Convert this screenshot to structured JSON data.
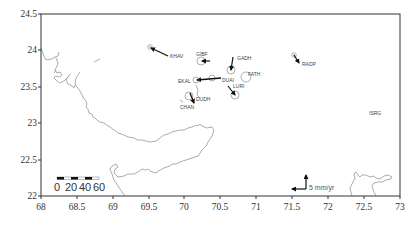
{
  "map": {
    "title": "",
    "frame": {
      "left": 41,
      "top": 14,
      "right": 400,
      "bottom": 196
    },
    "x_axis": {
      "min": 68,
      "max": 73,
      "ticks": [
        "68",
        "68.5",
        "69",
        "69.5",
        "70",
        "70.5",
        "71",
        "71.5",
        "72",
        "72.5",
        "73"
      ]
    },
    "y_axis": {
      "min": 22,
      "max": 24.5,
      "ticks": [
        "22",
        "22.5",
        "23",
        "23.5",
        "24",
        "24.5"
      ]
    },
    "scale_bar": {
      "labels": [
        "0",
        "20",
        "40",
        "60"
      ]
    },
    "reference_vector": {
      "label": "5 mm/yr"
    },
    "stations": [
      {
        "name": "KHAV",
        "lon": 69.55,
        "lat": 24.02,
        "ve": 4.0,
        "vn": -2.2
      },
      {
        "name": "GIBF",
        "lon": 70.25,
        "lat": 23.83,
        "ve": 1.0,
        "vn": 0.0
      },
      {
        "name": "GADH",
        "lon": 70.67,
        "lat": 23.73,
        "ve": 0.5,
        "vn": 2.6
      },
      {
        "name": "FATH",
        "lon": 70.98,
        "lat": 23.58,
        "ve": 0.0,
        "vn": 0.0
      },
      {
        "name": "EKAL",
        "lon": 70.08,
        "lat": 23.58,
        "ve": 0.0,
        "vn": 0.0
      },
      {
        "name": "DUAI",
        "lon": 70.45,
        "lat": 23.6,
        "ve": -5.0,
        "vn": 0.4
      },
      {
        "name": "LURI",
        "lon": 70.8,
        "lat": 23.35,
        "ve": -1.4,
        "vn": 2.6
      },
      {
        "name": "DUDH",
        "lon": 70.05,
        "lat": 23.4,
        "ve": -1.2,
        "vn": 2.4
      },
      {
        "name": "CHAN",
        "lon": 69.95,
        "lat": 23.4,
        "ve": 0.0,
        "vn": 0.0
      },
      {
        "name": "RADP",
        "lon": 71.5,
        "lat": 23.87,
        "ve": -1.2,
        "vn": 1.6
      },
      {
        "name": "ISRG",
        "lon": 72.8,
        "lat": 23.2,
        "ve": 0.0,
        "vn": 0.0
      }
    ]
  }
}
